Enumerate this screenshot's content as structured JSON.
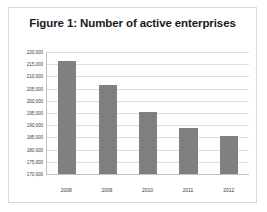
{
  "figure": {
    "title": "Figure 1: Number of active enterprises"
  },
  "colors": {
    "bar_fill": "#808080",
    "gridline": "#dedede",
    "axis_line": "#bfbfbf",
    "frame_border": "#d9d9d9",
    "background": "#ffffff",
    "title_text": "#1a1a1a",
    "tick_text": "#3c3c3c"
  },
  "chart_data": {
    "type": "bar",
    "title": "Figure 1: Number of active enterprises",
    "xlabel": "",
    "ylabel": "",
    "categories": [
      "2008",
      "2009",
      "2010",
      "2011",
      "2012"
    ],
    "values": [
      216300,
      206500,
      195400,
      189000,
      185400
    ],
    "series": [
      {
        "name": "Number of active enterprises",
        "values": [
          216300,
          206500,
          195400,
          189000,
          185400
        ]
      }
    ],
    "ylim": [
      170000,
      220000
    ],
    "ytick_step": 5000,
    "ytick_values": [
      220000,
      215000,
      210000,
      205000,
      200000,
      195000,
      190000,
      185000,
      180000,
      175000,
      170000
    ],
    "ytick_labels": [
      "220,000",
      "215,000",
      "210,000",
      "205,000",
      "200,000",
      "195,000",
      "190,000",
      "185,000",
      "180,000",
      "175,000",
      "170,000"
    ],
    "grid": "horizontal",
    "legend": "none"
  }
}
